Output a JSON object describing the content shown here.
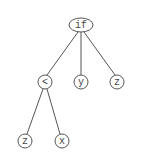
{
  "diagram": {
    "type": "tree",
    "colors": {
      "stroke": "#555555",
      "text": "#444444",
      "background": "#ffffff"
    },
    "nodes": [
      {
        "id": "n0",
        "label": "if",
        "shape": "ellipse",
        "cx": 81,
        "cy": 25,
        "rx": 12,
        "ry": 7
      },
      {
        "id": "n1",
        "label": "<",
        "shape": "circle",
        "cx": 45,
        "cy": 82,
        "r": 7
      },
      {
        "id": "n2",
        "label": "y",
        "shape": "circle",
        "cx": 81,
        "cy": 82,
        "r": 7
      },
      {
        "id": "n3",
        "label": "z",
        "shape": "circle",
        "cx": 117,
        "cy": 82,
        "r": 7
      },
      {
        "id": "n4",
        "label": "z",
        "shape": "circle",
        "cx": 25,
        "cy": 141,
        "r": 7
      },
      {
        "id": "n5",
        "label": "x",
        "shape": "circle",
        "cx": 62,
        "cy": 141,
        "r": 7
      }
    ],
    "edges": [
      {
        "from": "n0",
        "to": "n1"
      },
      {
        "from": "n0",
        "to": "n2"
      },
      {
        "from": "n0",
        "to": "n3"
      },
      {
        "from": "n1",
        "to": "n4"
      },
      {
        "from": "n1",
        "to": "n5"
      }
    ]
  }
}
